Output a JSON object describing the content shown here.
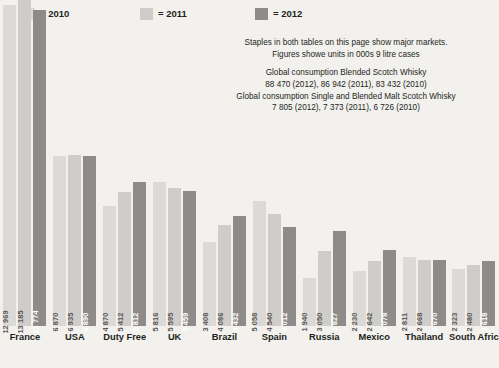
{
  "legend": {
    "items": [
      {
        "label": "= 2010",
        "color": "#dcdad6"
      },
      {
        "label": "= 2011",
        "color": "#cfcdc9"
      },
      {
        "label": "= 2012",
        "color": "#8d8c8a"
      }
    ]
  },
  "annotation": {
    "line1": "Staples in both tables on this page show major markets.",
    "line2": "Figures showe units in 000s 9 litre cases",
    "line3": "Global consumption Blended Scotch Whisky",
    "line4": "88 470 (2012), 86 942 (2011), 83 432 (2010)",
    "line5": "Global consumption Single and Blended Malt Scotch Whisky",
    "line6": "7 805 (2012), 7 373 (2011), 6 726 (2010)"
  },
  "chart_data": {
    "type": "bar",
    "title": "",
    "xlabel": "",
    "ylabel": "",
    "ylim": [
      0,
      13185
    ],
    "grid": false,
    "legend_position": "top-left",
    "categories": [
      "France",
      "USA",
      "Duty Free",
      "UK",
      "Brazil",
      "Spain",
      "Russia",
      "Mexico",
      "Thailand",
      "South Africa"
    ],
    "series": [
      {
        "name": "2010",
        "color": "#dcdad6",
        "values": [
          12969,
          6870,
          4870,
          5816,
          3408,
          5058,
          1940,
          2230,
          2811,
          2323
        ],
        "labels": [
          "12 969",
          "6 870",
          "4 870",
          "5 816",
          "3 408",
          "5 058",
          "1 940",
          "2 230",
          "2 811",
          "2 323"
        ]
      },
      {
        "name": "2011",
        "color": "#cfcdc9",
        "values": [
          13185,
          6935,
          5412,
          5595,
          4086,
          4540,
          3050,
          2642,
          2668,
          2480
        ],
        "labels": [
          "13 185",
          "6 935",
          "5 412",
          "5 595",
          "4 086",
          "4 540",
          "3 050",
          "2 642",
          "2 668",
          "2 480"
        ]
      },
      {
        "name": "2012",
        "color": "#8d8c8a",
        "values": [
          12774,
          6890,
          5812,
          5459,
          4432,
          4012,
          3827,
          3078,
          2670,
          2618
        ],
        "labels": [
          "12 774",
          "6 890",
          "5 812",
          "5 459",
          "4 432",
          "4 012",
          "3 827",
          "3 078",
          "2 670",
          "2 618"
        ]
      }
    ]
  }
}
